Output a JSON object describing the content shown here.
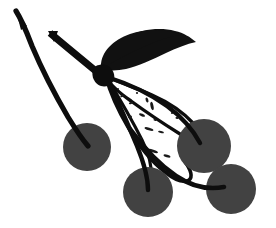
{
  "artwork": {
    "title": "Cherry branch with leaves",
    "subject": "cherries",
    "style": "black and white clip art silhouette",
    "width": 276,
    "height": 228,
    "background_color": "#ffffff",
    "ink_color": "#0d0d0d",
    "fruit_color": "#424242",
    "alt_text": "Silhouette illustration of a branch bearing four round cherries, one solid black leaf and one outlined speckled leaf"
  },
  "palette": {
    "background": "#ffffff",
    "outline": "#0d0d0d",
    "leaf_solid": "#111111",
    "cherry_fill": "#424242",
    "speckle": "#1a1a1a"
  },
  "elements": {
    "stem_long_label": "long curved stem",
    "stem_short_label": "short angled stem",
    "leaf_solid_label": "solid black leaf",
    "leaf_outlined_label": "outlined speckled leaf",
    "midrib_label": "leaf midrib vein",
    "cherry_left_label": "left cherry",
    "cherry_bottom_label": "bottom center cherry",
    "cherry_upper_right_label": "upper right cherry",
    "cherry_lower_right_label": "lower right cherry"
  },
  "geometry": {
    "cherries": [
      {
        "name": "cherry-left",
        "cx": 87,
        "cy": 147,
        "r": 24
      },
      {
        "name": "cherry-bottom",
        "cx": 148,
        "cy": 192,
        "r": 25
      },
      {
        "name": "cherry-upper-right",
        "cx": 204,
        "cy": 146,
        "r": 27
      },
      {
        "name": "cherry-lower-right",
        "cx": 231,
        "cy": 189,
        "r": 25
      }
    ],
    "speckles": [
      {
        "x": 122,
        "y": 96,
        "w": 3,
        "h": 2,
        "rot": -20
      },
      {
        "x": 130,
        "y": 103,
        "w": 4,
        "h": 2,
        "rot": -15
      },
      {
        "x": 119,
        "y": 108,
        "w": 3,
        "h": 2,
        "rot": 25
      },
      {
        "x": 137,
        "y": 92,
        "w": 2,
        "h": 2,
        "rot": 0
      },
      {
        "x": 147,
        "y": 99,
        "w": 3,
        "h": 5,
        "rot": 70
      },
      {
        "x": 152,
        "y": 104,
        "w": 3,
        "h": 8,
        "rot": 78
      },
      {
        "x": 160,
        "y": 100,
        "w": 3,
        "h": 2,
        "rot": 10
      },
      {
        "x": 166,
        "y": 106,
        "w": 2,
        "h": 2,
        "rot": 0
      },
      {
        "x": 141,
        "y": 114,
        "w": 6,
        "h": 3,
        "rot": 22
      },
      {
        "x": 129,
        "y": 116,
        "w": 4,
        "h": 3,
        "rot": -10
      },
      {
        "x": 154,
        "y": 119,
        "w": 3,
        "h": 2,
        "rot": 18
      },
      {
        "x": 148,
        "y": 128,
        "w": 9,
        "h": 3,
        "rot": 16
      },
      {
        "x": 160,
        "y": 131,
        "w": 6,
        "h": 2,
        "rot": 14
      },
      {
        "x": 139,
        "y": 137,
        "w": 4,
        "h": 2,
        "rot": 20
      },
      {
        "x": 152,
        "y": 150,
        "w": 10,
        "h": 3,
        "rot": 18
      },
      {
        "x": 166,
        "y": 155,
        "w": 7,
        "h": 3,
        "rot": 16
      },
      {
        "x": 118,
        "y": 88,
        "w": 2,
        "h": 2,
        "rot": 0
      },
      {
        "x": 171,
        "y": 112,
        "w": 2,
        "h": 2,
        "rot": 0
      },
      {
        "x": 176,
        "y": 117,
        "w": 3,
        "h": 2,
        "rot": 12
      }
    ]
  }
}
